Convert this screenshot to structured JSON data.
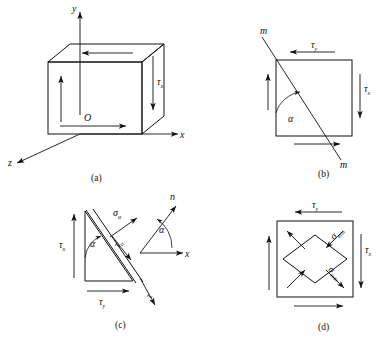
{
  "figure": {
    "background_color": "#ffffff",
    "line_color": "#111111"
  },
  "panels": [
    {
      "id": "a",
      "caption": "(a)",
      "kind": "3d-cube-element",
      "axes": {
        "y": "y",
        "x": "x",
        "z": "z",
        "origin": "O"
      },
      "labels": [
        {
          "name": "shear-stress-tau-x",
          "base": "τ",
          "sub": "x"
        }
      ],
      "arrows": [
        {
          "name": "top-face-arrow",
          "direction": "left"
        },
        {
          "name": "bottom-face-arrow",
          "direction": "right"
        },
        {
          "name": "left-face-arrow",
          "direction": "up"
        },
        {
          "name": "right-face-arrow",
          "direction": "down"
        }
      ]
    },
    {
      "id": "b",
      "caption": "(b)",
      "kind": "square-with-section-line",
      "section_label_top": "m",
      "section_label_bottom": "m",
      "angle_label": "α",
      "labels": [
        {
          "name": "shear-stress-tau-y",
          "base": "τ",
          "sub": "y"
        },
        {
          "name": "shear-stress-tau-x",
          "base": "τ",
          "sub": "x"
        }
      ],
      "arrows": [
        {
          "name": "top-face-arrow",
          "direction": "left"
        },
        {
          "name": "bottom-face-arrow",
          "direction": "right"
        },
        {
          "name": "left-face-arrow",
          "direction": "up"
        },
        {
          "name": "right-face-arrow",
          "direction": "down"
        }
      ]
    },
    {
      "id": "c",
      "caption": "(c)",
      "kind": "triangular-free-body",
      "angle_label": "α",
      "angle_label_axis": "α",
      "axis_x": "x",
      "normal_label": "n",
      "tangent_label": "τ",
      "labels": [
        {
          "name": "normal-stress-sigma-alpha",
          "base": "σ",
          "sub": "α"
        },
        {
          "name": "shear-stress-tau-alpha",
          "base": "τ",
          "sub": "α"
        },
        {
          "name": "shear-stress-tau-x",
          "base": "τ",
          "sub": "x"
        },
        {
          "name": "shear-stress-tau-y",
          "base": "τ",
          "sub": "y"
        }
      ]
    },
    {
      "id": "d",
      "caption": "(d)",
      "kind": "principal-stress-square",
      "labels": [
        {
          "name": "shear-stress-tau-y",
          "base": "τ",
          "sub": "y"
        },
        {
          "name": "shear-stress-tau-x",
          "base": "τ",
          "sub": "x"
        },
        {
          "name": "principal-stress-sigma-min",
          "base": "σ",
          "sub": "min"
        },
        {
          "name": "principal-stress-sigma-max",
          "base": "σ",
          "sub": "max"
        }
      ],
      "arrows": [
        {
          "name": "top-face-arrow",
          "direction": "left"
        },
        {
          "name": "bottom-face-arrow",
          "direction": "right"
        },
        {
          "name": "left-face-arrow",
          "direction": "up"
        },
        {
          "name": "right-face-arrow",
          "direction": "down"
        },
        {
          "name": "diagonal-tension-upper-left",
          "direction": "out"
        },
        {
          "name": "diagonal-tension-lower-left",
          "direction": "in"
        },
        {
          "name": "diagonal-compression-upper-right",
          "direction": "in"
        },
        {
          "name": "diagonal-compression-lower-right",
          "direction": "out"
        }
      ]
    }
  ]
}
